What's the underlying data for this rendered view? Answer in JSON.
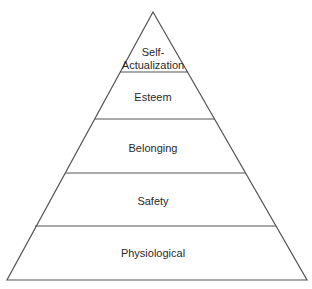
{
  "diagram": {
    "type": "pyramid",
    "stroke_color": "#555555",
    "text_color": "#2a2a2a",
    "levels": [
      {
        "label_line1": "Self-",
        "label_line2": "Actualization"
      },
      {
        "label": "Esteem"
      },
      {
        "label": "Belonging"
      },
      {
        "label": "Safety"
      },
      {
        "label": "Physiological"
      }
    ]
  }
}
